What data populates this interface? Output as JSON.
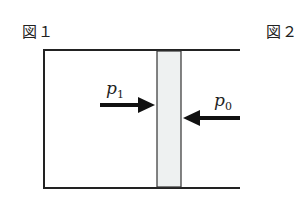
{
  "figures": {
    "fig1": {
      "label": "図１"
    },
    "fig2": {
      "label": "図２"
    }
  },
  "forces": {
    "left": {
      "symbol": "p",
      "subscript": "1",
      "direction": "right"
    },
    "right": {
      "symbol": "p",
      "subscript": "0",
      "direction": "left"
    }
  },
  "colors": {
    "stroke": "#222222",
    "piston_fill": "#eef1f1",
    "background": "#ffffff"
  }
}
